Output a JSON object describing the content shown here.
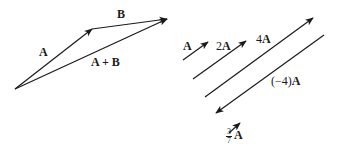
{
  "diagram": {
    "stroke_color": "#1a1a1a",
    "background": "#ffffff",
    "left_panel": {
      "vectors": [
        {
          "id": "A",
          "label": "A",
          "from": [
            15,
            89
          ],
          "to": [
            92,
            29
          ]
        },
        {
          "id": "B",
          "label": "B",
          "from": [
            92,
            29
          ],
          "to": [
            167,
            19
          ]
        },
        {
          "id": "A_plus_B",
          "label": "A + B",
          "from": [
            15,
            89
          ],
          "to": [
            167,
            19
          ]
        }
      ],
      "labels": {
        "A": "A",
        "B": "B",
        "A_plus_B": "A + B"
      }
    },
    "right_panel": {
      "vectors": [
        {
          "id": "A",
          "label": "A",
          "scale": 1,
          "from": [
            183,
            60
          ],
          "to": [
            208,
            42
          ]
        },
        {
          "id": "2A",
          "label": "2A",
          "scale": 2,
          "from": [
            193,
            79
          ],
          "to": [
            246,
            41
          ]
        },
        {
          "id": "4A",
          "label": "4A",
          "scale": 4,
          "from": [
            205,
            97
          ],
          "to": [
            313,
            18
          ]
        },
        {
          "id": "neg4A",
          "label": "(−4)A",
          "scale": -4,
          "from": [
            324,
            35
          ],
          "to": [
            216,
            113
          ]
        },
        {
          "id": "three_sevenths_A",
          "label": "3/7 A",
          "scale": 0.4286,
          "from": [
            229,
            133
          ],
          "to": [
            240,
            123
          ]
        }
      ],
      "labels": {
        "A": "A",
        "two_A_coef": "2",
        "two_A_vec": "A",
        "four_A_coef": "4",
        "four_A_vec": "A",
        "neg4_coef": "(−4)",
        "neg4_vec": "A",
        "frac_num": "3",
        "frac_den": "7",
        "frac_vec": "A"
      }
    }
  }
}
